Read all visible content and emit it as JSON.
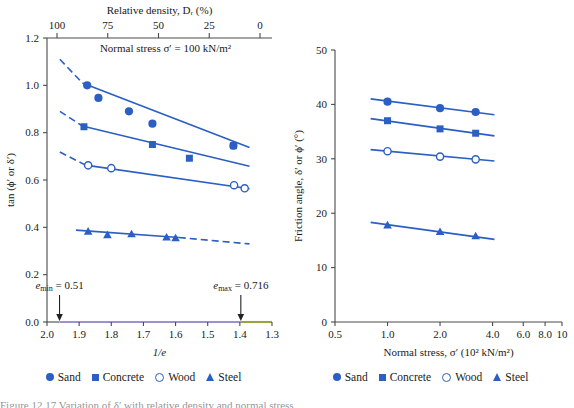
{
  "figure": {
    "caption": "Figure 12.17 Variation of δ′ with relative density and normal stress"
  },
  "legend": {
    "items": [
      {
        "label": "Sand",
        "marker": "filled-circle"
      },
      {
        "label": "Concrete",
        "marker": "filled-square"
      },
      {
        "label": "Wood",
        "marker": "open-circle"
      },
      {
        "label": "Steel",
        "marker": "filled-triangle"
      }
    ]
  },
  "colors": {
    "series": "#2b5fc4",
    "axis": "#4a4a4a",
    "text": "#1a1a1a",
    "band_loose": "#9b92d6",
    "band_dense": "#9aa34a"
  },
  "chart_data": [
    {
      "id": "left",
      "type": "scatter",
      "title": "",
      "annotation": "Normal stress σ′ = 100 kN/m²",
      "xlabel": "1/e",
      "ylabel": "tan (ϕ′ or δ′)",
      "xlabel_top": "Relative density, Dᵣ (%)",
      "xlim": [
        2.0,
        1.3
      ],
      "ylim": [
        0.0,
        1.2
      ],
      "xticks": [
        "2.0",
        "1.9",
        "1.8",
        "1.7",
        "1.6",
        "1.5",
        "1.4",
        "1.3"
      ],
      "xtick_values": [
        2.0,
        1.9,
        1.8,
        1.7,
        1.6,
        1.5,
        1.4,
        1.3
      ],
      "yticks": [
        "0.0",
        "0.2",
        "0.4",
        "0.6",
        "0.8",
        "1.0",
        "1.2"
      ],
      "ytick_values": [
        0.0,
        0.2,
        0.4,
        0.6,
        0.8,
        1.0,
        1.2
      ],
      "top_axis": {
        "label": "Relative density, Dᵣ (%)",
        "ticks": [
          "100",
          "75",
          "50",
          "25",
          "0"
        ],
        "tick_values": [
          100,
          75,
          50,
          25,
          0
        ],
        "minor_between": true
      },
      "grid": false,
      "legend_position": "below",
      "markers": [
        {
          "name": "e_min = 0.51",
          "x": 1.961,
          "label_main": "e",
          "label_sub": "min",
          "value": "0.51"
        },
        {
          "name": "e_max = 0.716",
          "x": 1.397,
          "label_main": "e",
          "label_sub": "max",
          "value": "0.716"
        }
      ],
      "series": [
        {
          "name": "Sand",
          "marker": "filled-circle",
          "points": [
            {
              "x": 1.875,
              "y": 1.0
            },
            {
              "x": 1.84,
              "y": 0.947
            },
            {
              "x": 1.745,
              "y": 0.89
            },
            {
              "x": 1.672,
              "y": 0.838
            },
            {
              "x": 1.42,
              "y": 0.745
            }
          ],
          "fit_solid": {
            "x": [
              1.89,
              1.37
            ],
            "y": [
              1.01,
              0.737
            ]
          },
          "fit_dashed": {
            "x": [
              1.96,
              1.89
            ],
            "y": [
              1.11,
              1.01
            ]
          }
        },
        {
          "name": "Concrete",
          "marker": "filled-square",
          "points": [
            {
              "x": 1.885,
              "y": 0.825
            },
            {
              "x": 1.672,
              "y": 0.75
            },
            {
              "x": 1.557,
              "y": 0.692
            },
            {
              "x": 1.42,
              "y": 0.745
            }
          ],
          "fit_solid": {
            "x": [
              1.89,
              1.37
            ],
            "y": [
              0.828,
              0.658
            ]
          },
          "fit_dashed": {
            "x": [
              1.96,
              1.89
            ],
            "y": [
              0.89,
              0.828
            ]
          }
        },
        {
          "name": "Wood",
          "marker": "open-circle",
          "points": [
            {
              "x": 1.872,
              "y": 0.662
            },
            {
              "x": 1.8,
              "y": 0.65
            },
            {
              "x": 1.418,
              "y": 0.578
            },
            {
              "x": 1.385,
              "y": 0.565
            }
          ],
          "fit_solid": {
            "x": [
              1.88,
              1.37
            ],
            "y": [
              0.663,
              0.563
            ]
          },
          "fit_dashed": {
            "x": [
              1.96,
              1.88
            ],
            "y": [
              0.718,
              0.663
            ]
          }
        },
        {
          "name": "Steel",
          "marker": "filled-triangle",
          "points": [
            {
              "x": 1.872,
              "y": 0.383
            },
            {
              "x": 1.812,
              "y": 0.368
            },
            {
              "x": 1.737,
              "y": 0.372
            },
            {
              "x": 1.628,
              "y": 0.358
            },
            {
              "x": 1.6,
              "y": 0.355
            }
          ],
          "fit_solid": {
            "x": [
              1.91,
              1.59
            ],
            "y": [
              0.388,
              0.357
            ]
          },
          "fit_dashed": {
            "x": [
              1.59,
              1.37
            ],
            "y": [
              0.357,
              0.33
            ]
          }
        }
      ]
    },
    {
      "id": "right",
      "type": "scatter",
      "title": "",
      "xlabel": "Normal stress, σ′ (10² kN/m²)",
      "ylabel": "Friction angle, δ′ or ϕ′ (°)",
      "xscale": "log",
      "xlim": [
        0.5,
        10
      ],
      "ylim": [
        0,
        50
      ],
      "xticks": [
        "0.5",
        "1.0",
        "2.0",
        "4.0",
        "6.0",
        "8.0",
        "10"
      ],
      "xtick_values": [
        0.5,
        1.0,
        2.0,
        4.0,
        6.0,
        8.0,
        10
      ],
      "yticks": [
        "0",
        "10",
        "20",
        "30",
        "40",
        "50"
      ],
      "ytick_values": [
        0,
        10,
        20,
        30,
        40,
        50
      ],
      "grid": false,
      "legend_position": "below",
      "series": [
        {
          "name": "Sand",
          "marker": "filled-circle",
          "points": [
            {
              "x": 1.0,
              "y": 40.5
            },
            {
              "x": 2.0,
              "y": 39.3
            },
            {
              "x": 3.2,
              "y": 38.6
            }
          ],
          "fit_solid": {
            "x": [
              0.8,
              4.1
            ],
            "y": [
              41.0,
              38.1
            ]
          }
        },
        {
          "name": "Concrete",
          "marker": "filled-square",
          "points": [
            {
              "x": 1.0,
              "y": 37.0
            },
            {
              "x": 2.0,
              "y": 35.5
            },
            {
              "x": 3.2,
              "y": 34.7
            }
          ],
          "fit_solid": {
            "x": [
              0.8,
              4.1
            ],
            "y": [
              37.4,
              34.2
            ]
          }
        },
        {
          "name": "Wood",
          "marker": "open-circle",
          "points": [
            {
              "x": 1.0,
              "y": 31.4
            },
            {
              "x": 2.0,
              "y": 30.4
            },
            {
              "x": 3.2,
              "y": 29.9
            }
          ],
          "fit_solid": {
            "x": [
              0.8,
              4.1
            ],
            "y": [
              31.7,
              29.6
            ]
          }
        },
        {
          "name": "Steel",
          "marker": "filled-triangle",
          "points": [
            {
              "x": 1.0,
              "y": 17.8
            },
            {
              "x": 2.0,
              "y": 16.6
            },
            {
              "x": 3.2,
              "y": 15.8
            }
          ],
          "fit_solid": {
            "x": [
              0.8,
              4.1
            ],
            "y": [
              18.3,
              15.2
            ]
          }
        }
      ]
    }
  ]
}
